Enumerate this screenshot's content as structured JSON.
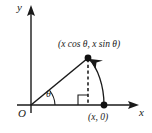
{
  "figure": {
    "axes": {
      "x_label": "x",
      "y_label": "y",
      "origin_label": "O"
    },
    "angle_label": "θ",
    "points": [
      {
        "name": "apex",
        "label": "(x cos θ, x sin θ)",
        "x": 88,
        "y": 58,
        "marker": "filled-dot"
      },
      {
        "name": "foot",
        "label": "(x, 0)",
        "x": 104,
        "y": 105,
        "marker": "filled-dot"
      }
    ],
    "colors": {
      "stroke": "#1a1a1a",
      "background": "#ffffff",
      "dashed": "#3a3a3a"
    },
    "elements": {
      "hypotenuse": "solid line from origin to apex",
      "dashed_drop": "vertical dashed segment from apex to x-axis",
      "right_angle_marker": "square at foot of perpendicular",
      "arc_arrow": "curved arrow from (x,0) to apex",
      "angle_arc": "small arc at origin marking theta"
    }
  }
}
